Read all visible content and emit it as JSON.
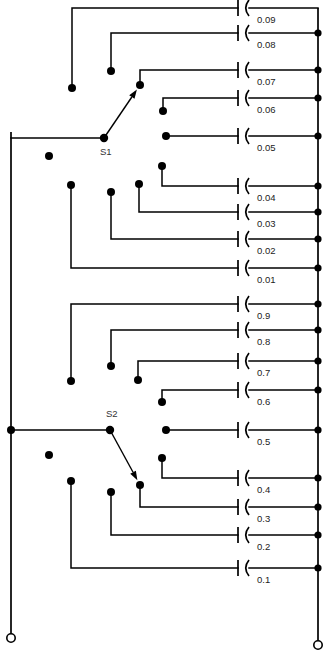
{
  "diagram": {
    "switches": [
      {
        "id": "S1",
        "label": "S1",
        "pivot_x": 104,
        "pivot_y": 138,
        "contact_x": 140,
        "contact_y": 85,
        "label_x": 100,
        "label_y": 152
      },
      {
        "id": "S2",
        "label": "S2",
        "pivot_x": 110,
        "pivot_y": 430,
        "contact_x": 140,
        "contact_y": 485,
        "label_x": 106,
        "label_y": 414
      }
    ],
    "terminals": [
      {
        "name": "left-terminal",
        "x": 11,
        "y": 638,
        "r": 4.2
      },
      {
        "name": "right-terminal",
        "x": 318,
        "y": 645,
        "r": 4.2
      }
    ],
    "rails": {
      "left_x": 11,
      "left_top_y": 132,
      "left_bottom_y": 634,
      "right_x": 318,
      "right_top_y": 8,
      "right_bottom_y": 641
    },
    "junctions": [
      {
        "name": "left-rail-s2-junction",
        "x": 11,
        "y": 430
      }
    ],
    "capacitor_geometry": {
      "plate_x": 238,
      "curve_x": 245,
      "plate_half_height": 8,
      "label_dx": 12,
      "label_dy": 12
    },
    "rows": [
      {
        "value": "0.09",
        "y": 8,
        "node_x": 72,
        "node_y": 88,
        "corner_x": 72,
        "rail_dot": false
      },
      {
        "value": "0.08",
        "y": 33,
        "node_x": 111,
        "node_y": 71,
        "corner_x": 111,
        "rail_dot": true
      },
      {
        "value": "0.07",
        "y": 70,
        "node_x": 140,
        "node_y": 85,
        "corner_x": 140,
        "rail_dot": true
      },
      {
        "value": "0.06",
        "y": 98,
        "node_x": 163,
        "node_y": 111,
        "corner_x": 163,
        "rail_dot": true
      },
      {
        "value": "0.05",
        "y": 136,
        "node_x": 166,
        "node_y": 136,
        "corner_x": 166,
        "rail_dot": true
      },
      {
        "value": "0.04",
        "y": 186,
        "node_x": 162,
        "node_y": 166,
        "corner_x": 162,
        "rail_dot": true
      },
      {
        "value": "0.03",
        "y": 212,
        "node_x": 139,
        "node_y": 184,
        "corner_x": 139,
        "rail_dot": true
      },
      {
        "value": "0.02",
        "y": 239,
        "node_x": 111,
        "node_y": 192,
        "corner_x": 111,
        "rail_dot": true
      },
      {
        "value": "0.01",
        "y": 268,
        "node_x": 71,
        "node_y": 185,
        "corner_x": 71,
        "rail_dot": true
      },
      {
        "value": "0.9",
        "y": 304,
        "node_x": 71,
        "node_y": 381,
        "corner_x": 71,
        "rail_dot": true
      },
      {
        "value": "0.8",
        "y": 330,
        "node_x": 111,
        "node_y": 366,
        "corner_x": 111,
        "rail_dot": true
      },
      {
        "value": "0.7",
        "y": 361,
        "node_x": 138,
        "node_y": 380,
        "corner_x": 138,
        "rail_dot": true
      },
      {
        "value": "0.6",
        "y": 390,
        "node_x": 162,
        "node_y": 402,
        "corner_x": 162,
        "rail_dot": true
      },
      {
        "value": "0.5",
        "y": 430,
        "node_x": 166,
        "node_y": 430,
        "corner_x": 166,
        "rail_dot": true
      },
      {
        "value": "0.4",
        "y": 478,
        "node_x": 162,
        "node_y": 458,
        "corner_x": 162,
        "rail_dot": true
      },
      {
        "value": "0.3",
        "y": 507,
        "node_x": 140,
        "node_y": 485,
        "corner_x": 140,
        "rail_dot": true
      },
      {
        "value": "0.2",
        "y": 535,
        "node_x": 111,
        "node_y": 492,
        "corner_x": 111,
        "rail_dot": true
      },
      {
        "value": "0.1",
        "y": 568,
        "node_x": 71,
        "node_y": 481,
        "corner_x": 71,
        "rail_dot": true
      }
    ],
    "loose_nodes": [
      {
        "name": "loose-node-s1-upper",
        "x": 49,
        "y": 156
      },
      {
        "name": "loose-node-s2-upper",
        "x": 49,
        "y": 455
      }
    ]
  }
}
